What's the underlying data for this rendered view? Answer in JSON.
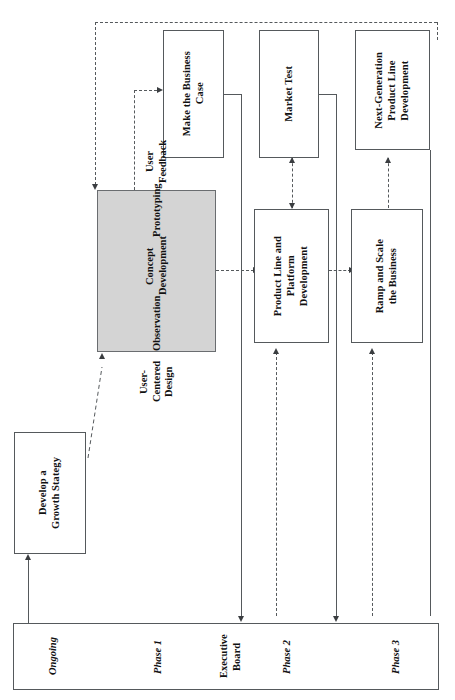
{
  "diagram": {
    "orientation": "rotated-90",
    "colors": {
      "shaded_fill": "#d4d4d4",
      "stroke": "#55595c",
      "text": "#111111",
      "background": "#ffffff"
    },
    "nodes": [
      {
        "id": "develop-growth-strategy",
        "label": "Develop a\nGrowth Stategy",
        "shaded": false
      },
      {
        "id": "user-centered-design",
        "label": "User-Centered Design",
        "items": [
          "Observation",
          "Concept Development",
          "Prototyping",
          "User Feedback"
        ],
        "shaded": true
      },
      {
        "id": "make-the-business-case",
        "label": "Make the Business\nCase",
        "shaded": false
      },
      {
        "id": "product-line-and-platform-development",
        "label": "Product Line and\nPlatform\nDevelopment",
        "shaded": false
      },
      {
        "id": "market-test",
        "label": "Market Test",
        "shaded": false
      },
      {
        "id": "ramp-and-scale-the-business",
        "label": "Ramp and Scale\nthe Business",
        "shaded": false
      },
      {
        "id": "next-generation-product-line-development",
        "label": "Next-Generation\nProduct Line\nDevelopment",
        "shaded": false
      }
    ],
    "phase_bar": {
      "labels": [
        {
          "id": "ongoing",
          "text": "Ongoing",
          "italic": true
        },
        {
          "id": "phase-1",
          "text": "Phase 1",
          "italic": true
        },
        {
          "id": "executive-board",
          "text": "Executive\nBoard",
          "italic": false
        },
        {
          "id": "phase-2",
          "text": "Phase 2",
          "italic": true
        },
        {
          "id": "phase-3",
          "text": "Phase 3",
          "italic": true
        }
      ]
    },
    "connectors": [
      {
        "id": "growth-strategy-to-ucd",
        "style": "dashed",
        "from": "develop-growth-strategy",
        "to": "user-centered-design"
      },
      {
        "id": "ucd-to-business-case",
        "style": "dashed",
        "from": "user-centered-design",
        "to": "make-the-business-case"
      },
      {
        "id": "ucd-to-product-line",
        "style": "dashed",
        "from": "user-centered-design",
        "to": "product-line-and-platform-development"
      },
      {
        "id": "product-line-to-market-test",
        "style": "dashed",
        "from": "product-line-and-platform-development",
        "to": "market-test"
      },
      {
        "id": "market-test-to-product-line",
        "style": "dashed",
        "from": "market-test",
        "to": "product-line-and-platform-development"
      },
      {
        "id": "product-line-to-ramp-scale",
        "style": "dashed",
        "from": "product-line-and-platform-development",
        "to": "ramp-and-scale-the-business"
      },
      {
        "id": "ramp-scale-to-next-generation",
        "style": "dashed",
        "from": "ramp-and-scale-the-business",
        "to": "next-generation-product-line-development"
      },
      {
        "id": "next-generation-feedback-to-ucd",
        "style": "dashed",
        "from": "next-generation-product-line-development",
        "to": "user-centered-design"
      },
      {
        "id": "phase-bar-to-growth-strategy",
        "style": "solid",
        "from": "phase-bar",
        "to": "develop-growth-strategy"
      },
      {
        "id": "business-case-to-executive-board",
        "style": "solid",
        "from": "make-the-business-case",
        "to": "phase-bar"
      },
      {
        "id": "market-test-to-phase-bar",
        "style": "solid",
        "from": "market-test",
        "to": "phase-bar"
      },
      {
        "id": "next-generation-to-phase-bar",
        "style": "solid",
        "from": "next-generation-product-line-development",
        "to": "phase-bar"
      },
      {
        "id": "phase-2-gate",
        "style": "dashed",
        "from": "phase-bar",
        "to": "product-line-and-platform-development"
      }
    ]
  }
}
